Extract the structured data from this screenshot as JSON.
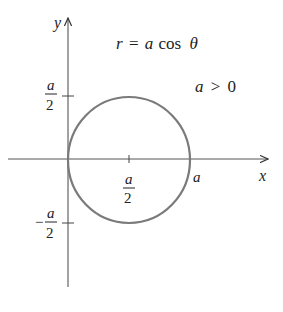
{
  "figure": {
    "equation": {
      "lhs": "r",
      "eq": "=",
      "a": "a",
      "fn": "cos",
      "theta": "θ"
    },
    "condition": {
      "a": "a",
      "op": ">",
      "rhs": "0"
    },
    "axes": {
      "x_label": "x",
      "y_label": "y"
    },
    "ticks": {
      "x": [
        {
          "num": "a",
          "den": "2",
          "label": "a/2"
        },
        {
          "label": "a"
        }
      ],
      "y": [
        {
          "num": "a",
          "den": "2",
          "label": "a/2"
        },
        {
          "sign": "−",
          "num": "a",
          "den": "2",
          "label": "-a/2"
        }
      ]
    },
    "colors": {
      "axis": "#333333",
      "curve": "#7a7a7a",
      "text": "#222222"
    },
    "curve": {
      "type": "circle",
      "description": "r = a cos θ, circle centered at (a/2, 0) with radius a/2"
    }
  }
}
